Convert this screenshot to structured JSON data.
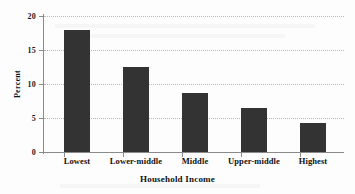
{
  "chart_data": {
    "type": "bar",
    "title": "",
    "categories": [
      "Lowest",
      "Lower-middle",
      "Middle",
      "Upper-middle",
      "Highest"
    ],
    "values": [
      18.0,
      12.5,
      8.7,
      6.5,
      4.3
    ],
    "xlabel": "Household Income",
    "ylabel": "Percent",
    "ylim": [
      0,
      20
    ],
    "yticks": [
      0,
      5,
      10,
      15,
      20
    ],
    "ytick_labels": [
      "0",
      "5",
      "10",
      "15",
      "20"
    ],
    "grid": "horizontal-dotted",
    "legend": "none",
    "bar_color": "#333333",
    "gridline_color": "#b9b9b9",
    "axis_color": "#8a8a8a",
    "background_color": "#fdfdfd"
  }
}
